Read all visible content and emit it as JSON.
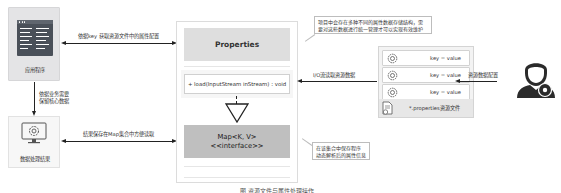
{
  "left": {
    "app_box": {
      "label": "应用程序",
      "icon": "application-window-icon"
    },
    "result_box": {
      "label": "数据处理结果",
      "icon": "monitor-gear-icon"
    },
    "vertical_arrow_label": [
      "依据业务需要",
      "保留核心数据"
    ]
  },
  "arrows": {
    "top_label": "依据key 获取资源文件中的属性配置",
    "bottom_label": "结果保存在Map集合中方便读取",
    "io_label": "I/O流读取资源数据",
    "config_label": "资源数据配置"
  },
  "uml": {
    "properties_title": "Properties",
    "method": "+ load(InputStream inStream) : void",
    "map_title_line1": "Map<K, V>",
    "map_title_line2": "<<interface>>"
  },
  "callouts": {
    "top": [
      "项目中会存在多种不同的属性数据存储结构，需",
      "要对这些数据进行统一管理才可以实现有效维护"
    ],
    "bottom": [
      "在该集合中保存程序",
      "动态解析后的属性信息"
    ]
  },
  "resource_file": {
    "rows": [
      {
        "icon": "gear-icon",
        "text": "key = value"
      },
      {
        "icon": "gear-icon",
        "text": "key = value"
      },
      {
        "icon": "gear-icon",
        "text": "key = value"
      }
    ],
    "footer_label": "*.properties资源文件",
    "footer_icon": "file-gear-icon"
  },
  "actor": {
    "icon": "user-gear-icon"
  },
  "caption": "图 资源文件与属性处理操作"
}
